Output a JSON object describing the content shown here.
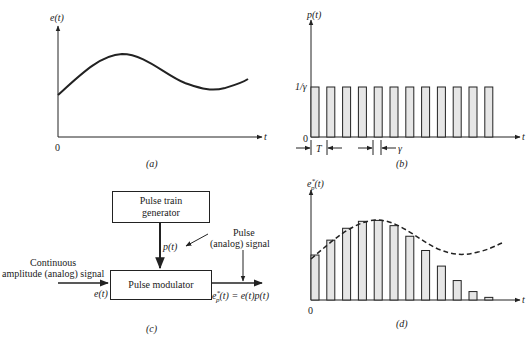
{
  "panel_a": {
    "caption": "(a)",
    "y_label": "e(t)",
    "x_label": "t",
    "origin": "0"
  },
  "panel_b": {
    "caption": "(b)",
    "y_label": "p(t)",
    "x_label": "t",
    "origin": "0",
    "level_label": "1/γ",
    "period_label": "T",
    "width_label": "γ",
    "pulse_count": 12
  },
  "panel_c": {
    "caption": "(c)",
    "generator_label_line1": "Pulse train",
    "generator_label_line2": "generator",
    "modulator_label": "Pulse modulator",
    "input_label_line1": "Continuous",
    "input_label_line2": "amplitude (analog) signal",
    "input_signal": "e(t)",
    "pulse_signal": "p(t)",
    "output_label_line1": "Pulse",
    "output_label_line2": "(analog) signal",
    "output_equation": "e*p(t) = e(t)p(t)"
  },
  "panel_d": {
    "caption": "(d)",
    "y_label": "e*p(t)",
    "x_label": "t",
    "origin": "0"
  },
  "chart_data": [
    {
      "type": "line",
      "title": "(a) Continuous signal e(t)",
      "xlabel": "t",
      "ylabel": "e(t)",
      "description": "Smooth continuous signal starting mid-level, rising to a maximum near 1/3 of the span, falling to a minimum near 80%, then rising again"
    },
    {
      "type": "bar",
      "title": "(b) Pulse train p(t)",
      "xlabel": "t",
      "ylabel": "p(t)",
      "pulse_amplitude": "1/γ",
      "period": "T",
      "pulse_width": "γ",
      "pulse_count": 12
    },
    {
      "type": "bar",
      "title": "(d) Pulse-modulated signal e*p(t)",
      "xlabel": "t",
      "ylabel": "e*p(t)",
      "description": "Pulses whose heights follow the envelope e(t) (dashed)",
      "pulse_count": 12
    }
  ]
}
